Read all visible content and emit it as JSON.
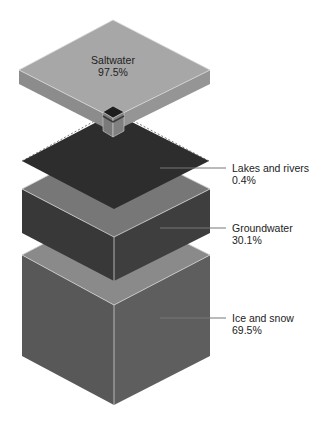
{
  "diagram": {
    "title": "",
    "blocks": [
      {
        "id": "saltwater",
        "label": "Saltwater",
        "value": "97.5%"
      },
      {
        "id": "lakes",
        "label": "Lakes and rivers",
        "value": "0.4%"
      },
      {
        "id": "groundwater",
        "label": "Groundwater",
        "value": "30.1%"
      },
      {
        "id": "ice",
        "label": "Ice and snow",
        "value": "69.5%"
      }
    ],
    "colors": {
      "saltwater_top": "#a7a7a7",
      "saltwater_side_left": "#8e8e8e",
      "saltwater_side_right": "#969696",
      "lakes": "#2e2e2e",
      "groundwater_top": "#787878",
      "groundwater_side": "#3c3c3c",
      "ice_top": "#8a8a8a",
      "ice_side": "#5a5a5a",
      "leader_line": "#777777"
    }
  }
}
